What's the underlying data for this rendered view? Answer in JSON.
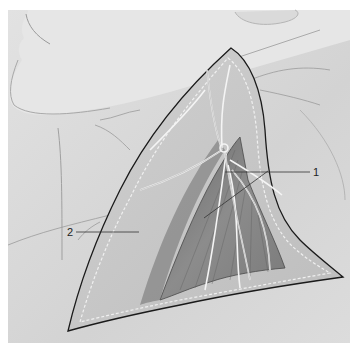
{
  "figure": {
    "colors": {
      "background": "#ffffff",
      "skin": "#d9d9d9",
      "skin_shadow": "#c4c4c4",
      "dissection_field": "#c8c8c8",
      "muscle": "#8f8f8f",
      "muscle_dark": "#5e5e5e",
      "outline": "#1a1a1a",
      "nerve": "#efefef",
      "vessel": "#9a9a9a",
      "leader_line": "#333333"
    },
    "labels": [
      {
        "id": "1",
        "text": "1"
      },
      {
        "id": "2",
        "text": "2"
      }
    ]
  }
}
